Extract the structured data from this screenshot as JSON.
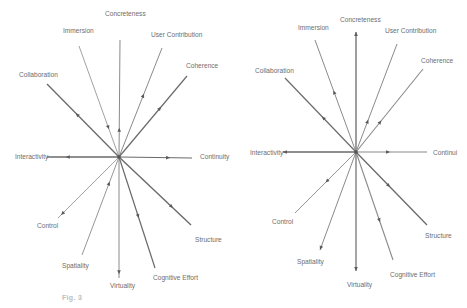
{
  "figure": {
    "caption_prefix": "Fig. 3",
    "caption_rest": ""
  },
  "colors": {
    "line": "#8a8a8a",
    "line_dark": "#6a6a6a",
    "label": "#6e6e6e",
    "arrow": "#5a5a5a"
  },
  "diagrams": [
    {
      "id": "left",
      "center": [
        119,
        157
      ],
      "axes": [
        {
          "label": "Concreteness",
          "end": [
            120,
            40
          ],
          "text_pos": [
            105,
            16
          ],
          "arrow_t": 0.25,
          "arrow_dir": "out",
          "weight": 1.0
        },
        {
          "label": "Immersion",
          "end": [
            79,
            46
          ],
          "text_pos": [
            63,
            33
          ],
          "arrow_t": 0.25,
          "arrow_dir": "in",
          "weight": 0.8
        },
        {
          "label": "User Contribution",
          "end": [
            162,
            48
          ],
          "text_pos": [
            151,
            37
          ],
          "arrow_t": 0.58,
          "arrow_dir": "out",
          "weight": 1.0
        },
        {
          "label": "Coherence",
          "end": [
            187,
            76
          ],
          "text_pos": [
            186,
            68
          ],
          "arrow_t": 0.62,
          "arrow_dir": "out",
          "weight": 1.2
        },
        {
          "label": "Collaboration",
          "end": [
            47,
            84
          ],
          "text_pos": [
            19,
            77
          ],
          "arrow_t": 0.6,
          "arrow_dir": "out",
          "weight": 1.3
        },
        {
          "label": "Interactivity",
          "end": [
            47,
            157
          ],
          "text_pos": [
            15,
            159
          ],
          "arrow_t": 0.74,
          "arrow_dir": "out",
          "weight": 1.4
        },
        {
          "label": "Continuity",
          "end": [
            192,
            158
          ],
          "text_pos": [
            200,
            159
          ],
          "arrow_t": 0.7,
          "arrow_dir": "out",
          "weight": 1.2
        },
        {
          "label": "Control",
          "end": [
            58,
            218
          ],
          "text_pos": [
            37,
            228
          ],
          "arrow_t": 0.95,
          "arrow_dir": "out",
          "weight": 0.8
        },
        {
          "label": "Spatiality",
          "end": [
            82,
            255
          ],
          "text_pos": [
            62,
            268
          ],
          "arrow_t": 0.25,
          "arrow_dir": "in",
          "weight": 0.9
        },
        {
          "label": "Virtuality",
          "end": [
            119,
            278
          ],
          "text_pos": [
            110,
            288
          ],
          "arrow_t": 0.97,
          "arrow_dir": "out",
          "weight": 1.0
        },
        {
          "label": "Cognitive Effort",
          "end": [
            155,
            268
          ],
          "text_pos": [
            153,
            280
          ],
          "arrow_t": 0.55,
          "arrow_dir": "out",
          "weight": 1.2
        },
        {
          "label": "Structure",
          "end": [
            191,
            225
          ],
          "text_pos": [
            195,
            242
          ],
          "arrow_t": 0.75,
          "arrow_dir": "out",
          "weight": 1.4
        }
      ]
    },
    {
      "id": "right",
      "center": [
        356,
        152
      ],
      "axes": [
        {
          "label": "Concreteness",
          "end": [
            356,
            32
          ],
          "text_pos": [
            340,
            22
          ],
          "arrow_t": 1.0,
          "arrow_dir": "out",
          "weight": 1.3
        },
        {
          "label": "Immersion",
          "end": [
            315,
            40
          ],
          "text_pos": [
            298,
            30
          ],
          "arrow_t": 0.55,
          "arrow_dir": "out",
          "weight": 1.0
        },
        {
          "label": "User Contribution",
          "end": [
            397,
            44
          ],
          "text_pos": [
            385,
            33
          ],
          "arrow_t": 0.3,
          "arrow_dir": "out",
          "weight": 1.0
        },
        {
          "label": "Coherence",
          "end": [
            423,
            69
          ],
          "text_pos": [
            421,
            63
          ],
          "arrow_t": 0.38,
          "arrow_dir": "out",
          "weight": 1.1
        },
        {
          "label": "Collaboration",
          "end": [
            285,
            78
          ],
          "text_pos": [
            255,
            73
          ],
          "arrow_t": 0.48,
          "arrow_dir": "out",
          "weight": 1.2
        },
        {
          "label": "Interactivity",
          "end": [
            283,
            152
          ],
          "text_pos": [
            250,
            155
          ],
          "arrow_t": 1.0,
          "arrow_dir": "out",
          "weight": 1.4
        },
        {
          "label": "Continui",
          "end": [
            427,
            152
          ],
          "text_pos": [
            433,
            155
          ],
          "arrow_t": 0.48,
          "arrow_dir": "out",
          "weight": 1.1
        },
        {
          "label": "Control",
          "end": [
            295,
            213
          ],
          "text_pos": [
            272,
            224
          ],
          "arrow_t": 0.5,
          "arrow_dir": "out",
          "weight": 0.9
        },
        {
          "label": "Spatiality",
          "end": [
            320,
            250
          ],
          "text_pos": [
            297,
            264
          ],
          "arrow_t": 1.0,
          "arrow_dir": "out",
          "weight": 1.0
        },
        {
          "label": "Virtuality",
          "end": [
            356,
            271
          ],
          "text_pos": [
            347,
            287
          ],
          "arrow_t": 1.0,
          "arrow_dir": "out",
          "weight": 1.2
        },
        {
          "label": "Cognitive Effort",
          "end": [
            393,
            260
          ],
          "text_pos": [
            390,
            277
          ],
          "arrow_t": 0.65,
          "arrow_dir": "out",
          "weight": 1.1
        },
        {
          "label": "Structure",
          "end": [
            427,
            225
          ],
          "text_pos": [
            425,
            238
          ],
          "arrow_t": 0.48,
          "arrow_dir": "out",
          "weight": 1.3
        }
      ]
    }
  ]
}
